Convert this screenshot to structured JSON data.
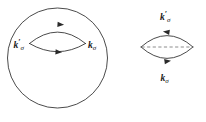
{
  "figure": {
    "background_color": "#ffffff",
    "line_color": "#2a2a2a",
    "dashed_line_color": "#6e6e6e",
    "text_color": "#1a1a1a",
    "panels": [
      {
        "id": "left-panel",
        "name": "fermi-surface-panel",
        "has_outer_circle": true,
        "has_dashed_chord": false,
        "labels": [
          {
            "id": "left-kprime-sigma",
            "name": "label-k-prime-sigma",
            "symbol": "k",
            "prime": "′",
            "subscript": "σ",
            "text": "k′σ",
            "position": "left-of-lens"
          },
          {
            "id": "left-k-sigma",
            "name": "label-k-sigma",
            "symbol": "k",
            "prime": "",
            "subscript": "σ",
            "text": "kσ",
            "position": "right-of-lens"
          }
        ],
        "arrows": [
          {
            "id": "left-top-arrow",
            "on": "upper-arc",
            "direction": "right"
          },
          {
            "id": "left-bottom-arrow",
            "on": "lower-arc",
            "direction": "right"
          }
        ]
      },
      {
        "id": "right-panel",
        "name": "lens-panel",
        "has_outer_circle": false,
        "has_dashed_chord": true,
        "labels": [
          {
            "id": "right-kprime-sigma",
            "name": "label-k-prime-sigma",
            "symbol": "k",
            "prime": "′",
            "subscript": "σ",
            "text": "k′σ",
            "position": "above-lens"
          },
          {
            "id": "right-k-sigma",
            "name": "label-k-sigma",
            "symbol": "k",
            "prime": "",
            "subscript": "σ",
            "text": "kσ",
            "position": "below-lens"
          }
        ],
        "arrows": [
          {
            "id": "right-top-arrow",
            "on": "upper-arc",
            "direction": "left"
          },
          {
            "id": "right-bottom-arrow",
            "on": "lower-arc",
            "direction": "right"
          }
        ]
      }
    ]
  }
}
